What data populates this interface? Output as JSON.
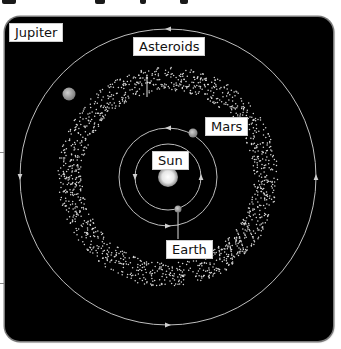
{
  "diagram": {
    "labels": {
      "sun": "Sun",
      "earth": "Earth",
      "mars": "Mars",
      "asteroids": "Asteroids",
      "jupiter": "Jupiter"
    },
    "colors": {
      "background": "#000000",
      "orbit": "#bdbdbd",
      "asteroid": "#d8d8d8",
      "planet": "#9a9a9a",
      "sun": "#ffffff"
    },
    "bodies": [
      {
        "name": "Sun",
        "orbit_order": 0
      },
      {
        "name": "Earth",
        "orbit_order": 1
      },
      {
        "name": "Mars",
        "orbit_order": 2
      },
      {
        "name": "Asteroids",
        "orbit_order": 3
      },
      {
        "name": "Jupiter",
        "orbit_order": 4
      }
    ],
    "orbit_direction": "counterclockwise"
  }
}
